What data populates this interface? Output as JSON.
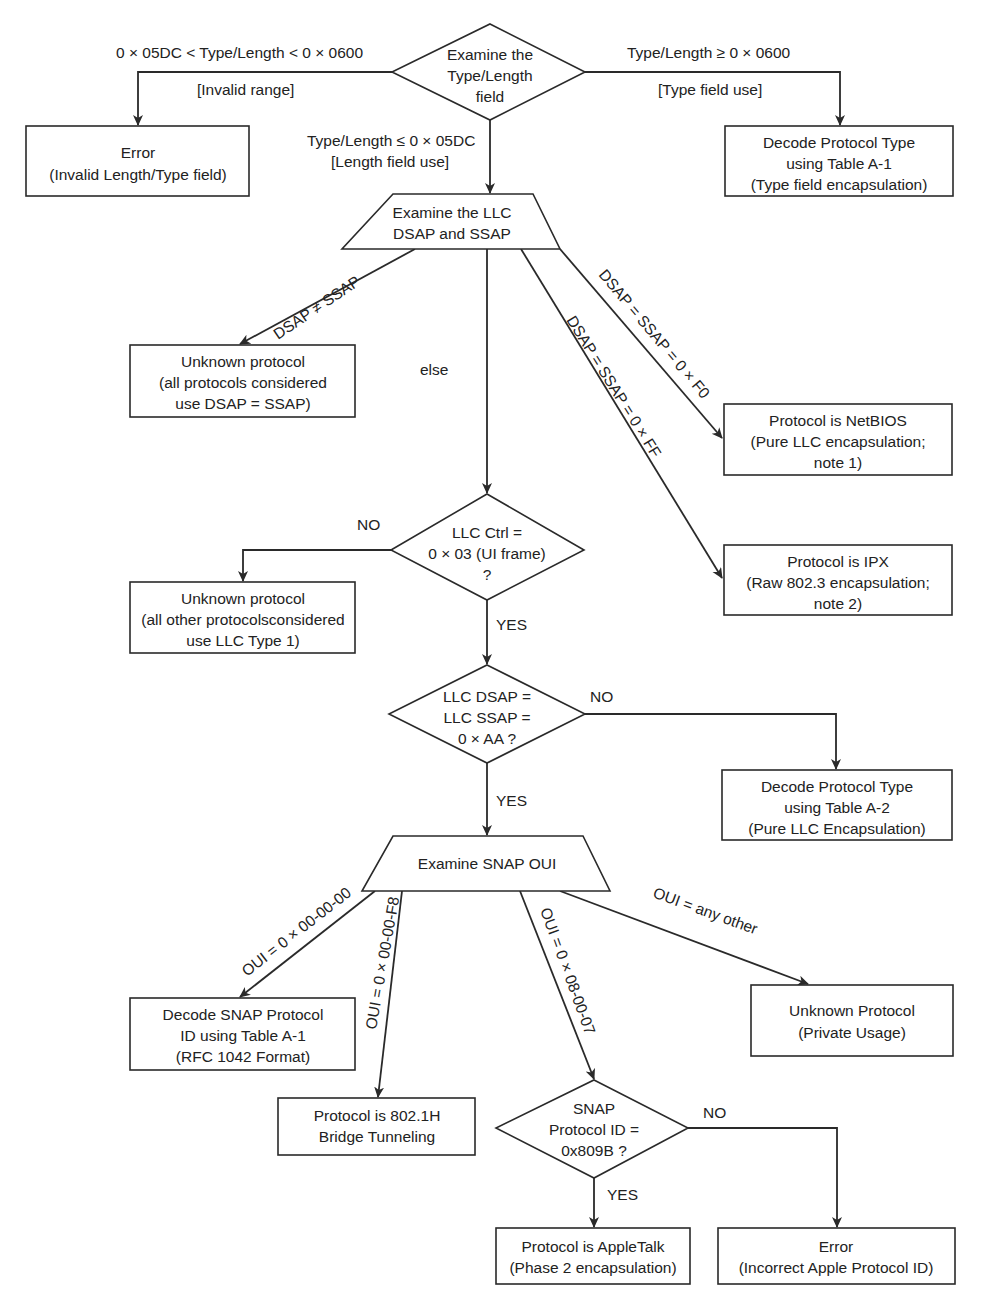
{
  "diagram": {
    "colors": {
      "stroke": "#2a2a2a",
      "text": "#222222",
      "background": "#ffffff"
    },
    "nodes": {
      "examine_type_length": {
        "shape": "diamond",
        "lines": [
          "Examine the",
          "Type/Length",
          "field"
        ]
      },
      "error_invalid_length": {
        "shape": "rect",
        "lines": [
          "Error",
          "(Invalid Length/Type field)"
        ]
      },
      "decode_table_a1_type": {
        "shape": "rect",
        "lines": [
          "Decode Protocol Type",
          "using Table A-1",
          "(Type field encapsulation)"
        ]
      },
      "examine_llc": {
        "shape": "trapezoid",
        "lines": [
          "Examine the LLC",
          "DSAP and SSAP"
        ]
      },
      "unknown_protocol_dsap": {
        "shape": "rect",
        "lines": [
          "Unknown protocol",
          "(all protocols considered",
          "use DSAP = SSAP)"
        ]
      },
      "netbios": {
        "shape": "rect",
        "lines": [
          "Protocol is NetBIOS",
          "(Pure LLC encapsulation;",
          "note 1)"
        ]
      },
      "ipx": {
        "shape": "rect",
        "lines": [
          "Protocol is IPX",
          "(Raw 802.3 encapsulation;",
          "note 2)"
        ]
      },
      "llc_ctrl": {
        "shape": "diamond",
        "lines": [
          "LLC Ctrl =",
          "0 × 03 (UI frame)",
          "?"
        ]
      },
      "unknown_protocol_llc1": {
        "shape": "rect",
        "lines": [
          "Unknown protocol",
          "(all other protocolsconsidered",
          "use LLC Type 1)"
        ]
      },
      "llc_dsap_ssap_aa": {
        "shape": "diamond",
        "lines": [
          "LLC DSAP =",
          "LLC SSAP =",
          "0 × AA ?"
        ]
      },
      "decode_table_a2": {
        "shape": "rect",
        "lines": [
          "Decode Protocol Type",
          "using Table A-2",
          "(Pure LLC Encapsulation)"
        ]
      },
      "examine_snap_oui": {
        "shape": "trapezoid",
        "lines": [
          "Examine SNAP OUI"
        ]
      },
      "decode_snap_a1": {
        "shape": "rect",
        "lines": [
          "Decode SNAP Protocol",
          "ID using Table A-1",
          "(RFC 1042 Format)"
        ]
      },
      "bridge_tunneling": {
        "shape": "rect",
        "lines": [
          "Protocol is 802.1H",
          "Bridge Tunneling"
        ]
      },
      "unknown_private": {
        "shape": "rect",
        "lines": [
          "Unknown Protocol",
          "(Private Usage)"
        ]
      },
      "snap_protocol_id": {
        "shape": "diamond",
        "lines": [
          "SNAP",
          "Protocol ID =",
          "0x809B ?"
        ]
      },
      "appletalk": {
        "shape": "rect",
        "lines": [
          "Protocol is AppleTalk",
          "(Phase 2 encapsulation)"
        ]
      },
      "error_apple_id": {
        "shape": "rect",
        "lines": [
          "Error",
          "(Incorrect Apple Protocol ID)"
        ]
      }
    },
    "edges": {
      "invalid_range_cond": "0 × 05DC < Type/Length < 0 × 0600",
      "invalid_range_note": "[Invalid range]",
      "type_field_cond": "Type/Length ≥ 0 × 0600",
      "type_field_note": "[Type field use]",
      "length_field_cond": "Type/Length ≤ 0 × 05DC",
      "length_field_note": "[Length field use]",
      "dsap_ne_ssap": "DSAP ≠ SSAP",
      "else": "else",
      "dsap_f0": "DSAP = SSAP = 0 × F0",
      "dsap_ff": "DSAP = SSAP = 0 × FF",
      "llc_ctrl_no": "NO",
      "llc_ctrl_yes": "YES",
      "aa_no": "NO",
      "aa_yes": "YES",
      "oui_000000": "OUI = 0 × 00-00-00",
      "oui_0000f8": "OUI = 0 × 00-00-F8",
      "oui_080007": "OUI = 0 × 08-00-07",
      "oui_other": "OUI = any other",
      "snap_no": "NO",
      "snap_yes": "YES"
    }
  }
}
